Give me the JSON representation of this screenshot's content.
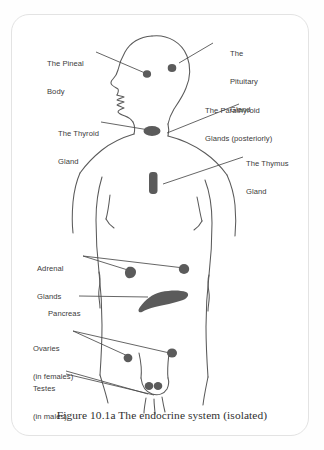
{
  "figure": {
    "caption": "Figure 10.1a The endocrine system (isolated)",
    "frame_color": "#e3e3e3",
    "outline_color": "#5a5a5a",
    "leader_color": "#4a4a4a",
    "gland_color": "#5b5b5b",
    "text_color": "#3b3b3b",
    "background": "#ffffff"
  },
  "labels": {
    "pineal": {
      "line1": "The Pineal",
      "line2": "Body"
    },
    "pituitary": {
      "line1": "The",
      "line2": "Pituitary",
      "line3": "Gland"
    },
    "parathyroid": {
      "line1": "The Parathyroid",
      "line2": "Glands (posteriorly)"
    },
    "thyroid": {
      "line1": "The Thyroid",
      "line2": "Gland"
    },
    "thymus": {
      "line1": "The Thymus",
      "line2": "Gland"
    },
    "adrenal": {
      "line1": "Adrenal",
      "line2": "Glands"
    },
    "pancreas": {
      "line1": "Pancreas"
    },
    "ovaries": {
      "line1": "Ovaries",
      "line2": "(in females)"
    },
    "testes": {
      "line1": "Testes",
      "line2": "(in males)"
    }
  },
  "glands": [
    {
      "name": "pineal-body",
      "shape": "dot"
    },
    {
      "name": "pituitary-gland",
      "shape": "dot"
    },
    {
      "name": "thyroid-gland",
      "shape": "blob"
    },
    {
      "name": "thymus-gland",
      "shape": "bar"
    },
    {
      "name": "adrenal-gland-left",
      "shape": "dot"
    },
    {
      "name": "adrenal-gland-right",
      "shape": "dot"
    },
    {
      "name": "pancreas",
      "shape": "elongated"
    },
    {
      "name": "ovary-left",
      "shape": "dot"
    },
    {
      "name": "ovary-right",
      "shape": "dot"
    },
    {
      "name": "testis-left",
      "shape": "dot"
    },
    {
      "name": "testis-right",
      "shape": "dot"
    }
  ]
}
